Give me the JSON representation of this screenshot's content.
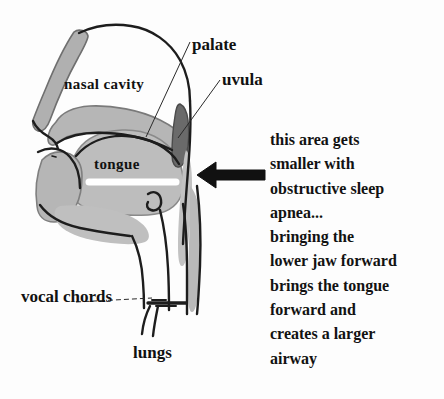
{
  "figure": {
    "background_color": "#fdfdfd",
    "ink_color": "#1a1a1a",
    "tissue_gray": "#b3b3b3",
    "tissue_gray_dark": "#8f8f8f",
    "tissue_gray_light": "#c9c9c9"
  },
  "labels": {
    "palate": "palate",
    "uvula": "uvula",
    "nasal_cavity": "nasal cavity",
    "tongue": "tongue",
    "vocal_chords": "vocal chords",
    "lungs": "lungs"
  },
  "callout": {
    "lines": [
      "this area gets",
      "smaller with",
      "obstructive sleep",
      "apnea...",
      "bringing the",
      "lower jaw forward",
      "brings the tongue",
      "forward and",
      "creates a larger",
      "airway"
    ],
    "full_text": "this area gets smaller with obstructive sleep apnea... bringing the lower jaw forward brings the tongue forward and creates a larger airway"
  },
  "arrow": {
    "name": "left-pointing-arrow",
    "direction": "left",
    "points_to": "airway behind tongue and uvula",
    "color": "#111111"
  },
  "leader_lines": [
    {
      "name": "palate-leader",
      "from_label": "palate",
      "to_structure": "soft palate"
    },
    {
      "name": "uvula-leader",
      "from_label": "uvula",
      "to_structure": "uvula"
    },
    {
      "name": "vocal-chords-leader",
      "from_label": "vocal chords",
      "to_structure": "vocal chords"
    }
  ]
}
